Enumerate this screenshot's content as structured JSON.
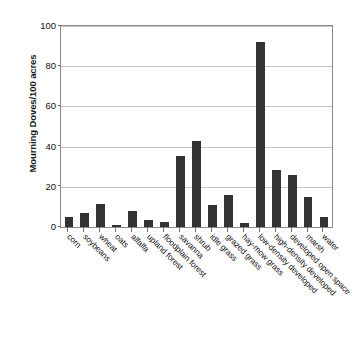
{
  "chart_data": {
    "type": "bar",
    "title": "",
    "subtitle": "",
    "xlabel": "",
    "ylabel": "Mourning Doves/100 acres",
    "ylim": [
      0,
      100
    ],
    "yticks": [
      0,
      20,
      40,
      60,
      80,
      100
    ],
    "grid": "horizontal",
    "legend": "none",
    "bar_color": "#333333",
    "categories": [
      "corn",
      "soybeans",
      "wheat",
      "oats",
      "alfalfa",
      "upland forest",
      "floodplain forest",
      "savanna",
      "shrub",
      "idle grass",
      "grazed grass",
      "hay-mow grass",
      "low-density developed",
      "high-density developed",
      "developed open space",
      "marsh",
      "water"
    ],
    "values": [
      5,
      7,
      11.5,
      1,
      8,
      3.5,
      2.5,
      35.5,
      43,
      11,
      16,
      2,
      92,
      28.5,
      26,
      15,
      5
    ]
  },
  "axes": {
    "y_title": "Mourning Doves/100 acres",
    "y_tick_labels": [
      "100",
      "80",
      "60",
      "40",
      "20",
      "0"
    ]
  },
  "top_caption": ""
}
